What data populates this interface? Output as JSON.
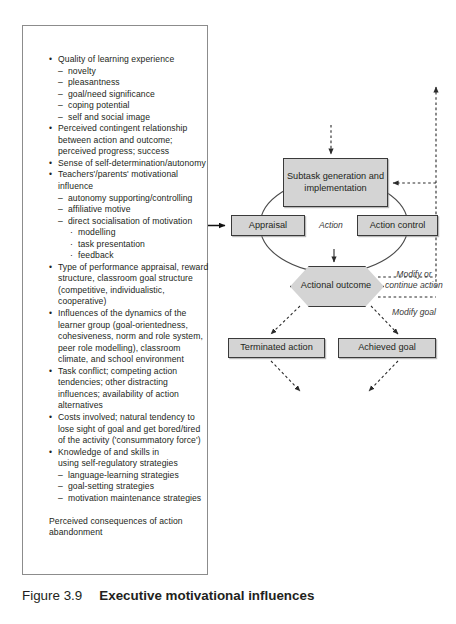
{
  "figure": {
    "number": "Figure 3.9",
    "title": "Executive motivational influences"
  },
  "factors_panel": {
    "name": "executive motivational influences factor list",
    "items": [
      {
        "level": 1,
        "text": "Quality of learning experience"
      },
      {
        "level": 2,
        "text": "novelty"
      },
      {
        "level": 2,
        "text": "pleasantness"
      },
      {
        "level": 2,
        "text": "goal/need significance"
      },
      {
        "level": 2,
        "text": "coping potential"
      },
      {
        "level": 2,
        "text": "self and social image"
      },
      {
        "level": 1,
        "text": "Perceived contingent relationship"
      },
      {
        "level": 0,
        "text": "between action and outcome;"
      },
      {
        "level": 0,
        "text": "perceived progress; success"
      },
      {
        "level": 1,
        "text": "Sense of self-determination/autonomy"
      },
      {
        "level": 1,
        "text": "Teachers'/parents' motivational"
      },
      {
        "level": 0,
        "text": "influence"
      },
      {
        "level": 2,
        "text": "autonomy supporting/controlling"
      },
      {
        "level": 2,
        "text": "affiliative motive"
      },
      {
        "level": 2,
        "text": "direct socialisation of motivation"
      },
      {
        "level": 3,
        "text": "modelling"
      },
      {
        "level": 3,
        "text": "task presentation"
      },
      {
        "level": 3,
        "text": "feedback"
      },
      {
        "level": 1,
        "text": "Type of performance appraisal, reward"
      },
      {
        "level": 0,
        "text": "structure, classroom goal structure"
      },
      {
        "level": 0,
        "text": "(competitive, individualistic,"
      },
      {
        "level": 0,
        "text": "cooperative)"
      },
      {
        "level": 1,
        "text": "Influences of the dynamics of the"
      },
      {
        "level": 0,
        "text": "learner group (goal-orientedness,"
      },
      {
        "level": 0,
        "text": "cohesiveness, norm and role system,"
      },
      {
        "level": 0,
        "text": "peer role modelling), classroom"
      },
      {
        "level": 0,
        "text": "climate, and school environment"
      },
      {
        "level": 1,
        "text": "Task conflict; competing action"
      },
      {
        "level": 0,
        "text": "tendencies; other distracting"
      },
      {
        "level": 0,
        "text": "influences; availability of action"
      },
      {
        "level": 0,
        "text": "alternatives"
      },
      {
        "level": 1,
        "text": "Costs involved; natural tendency to"
      },
      {
        "level": 0,
        "text": "lose sight of goal and get bored/tired"
      },
      {
        "level": 0,
        "text": "of the activity ('consummatory force')"
      },
      {
        "level": 1,
        "text": "Knowledge of and skills in"
      },
      {
        "level": 0,
        "text": "using self-regulatory strategies"
      },
      {
        "level": 2,
        "text": "language-learning strategies"
      },
      {
        "level": 2,
        "text": "goal-setting strategies"
      },
      {
        "level": 2,
        "text": "motivation maintenance strategies"
      },
      {
        "level": -1,
        "text": ""
      },
      {
        "level": 4,
        "text": "Perceived consequences of action"
      },
      {
        "level": 4,
        "text": "abandonment"
      }
    ]
  },
  "flowchart": {
    "nodes": {
      "subtask": "Subtask generation and implementation",
      "appraisal": "Appraisal",
      "action_control": "Action control",
      "actional_outcome": "Actional outcome",
      "terminated_action": "Terminated action",
      "achieved_goal": "Achieved goal"
    },
    "edge_labels": {
      "action": "Action",
      "modify_or_continue_action": "Modify or continue action",
      "modify_goal": "Modify goal"
    }
  },
  "colors": {
    "node_fill": "#d4d4d4",
    "node_border": "#3a3a3a",
    "panel_border": "#8c8c8c",
    "text": "#231f20",
    "edge": "#4a4a4a"
  }
}
